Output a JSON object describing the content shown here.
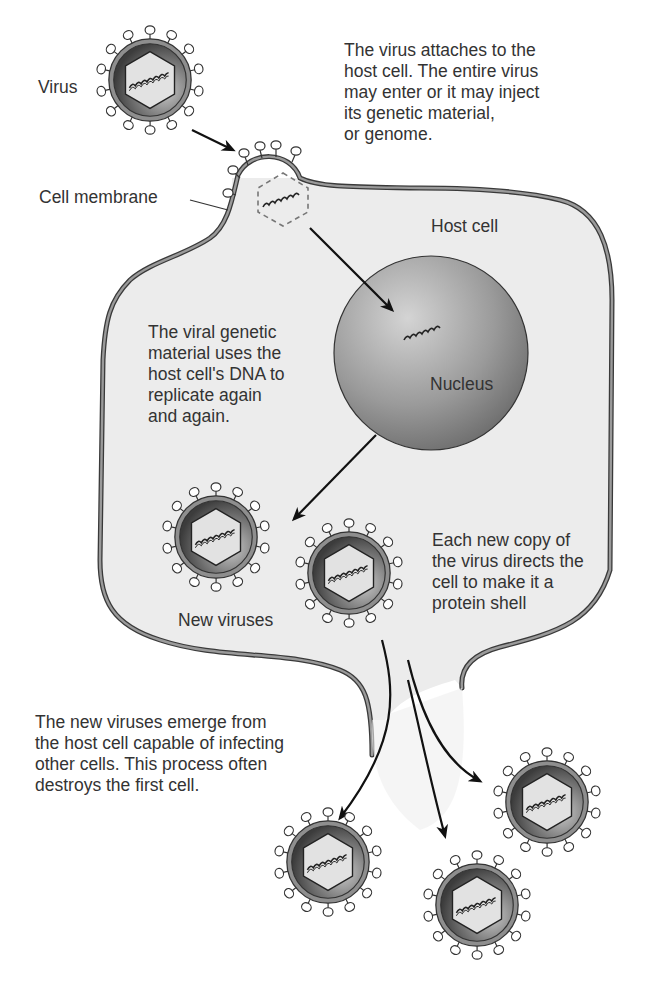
{
  "diagram": {
    "colors": {
      "cell_fill": "#ececec",
      "membrane": "#8c8c8c",
      "membrane_edge": "#3a3a3a",
      "virus_capsule_dark": "#4a4a4a",
      "virus_capsule_light": "#bdbdbd",
      "hexagon_fill": "#e0e0e0",
      "nucleus_light": "#c9c9c9",
      "nucleus_dark": "#6e6e6e",
      "arrow": "#111111",
      "text": "#333333"
    },
    "labels": {
      "virus": "Virus",
      "cell_membrane": "Cell membrane",
      "host_cell": "Host cell",
      "nucleus": "Nucleus",
      "new_viruses": "New viruses"
    },
    "captions": {
      "attach": "The virus attaches to the\nhost cell. The entire virus\nmay enter or it may inject\nits genetic material,\nor genome.",
      "replicate": "The viral genetic\nmaterial uses the\nhost cell's DNA to\nreplicate again\nand again.",
      "shell": "Each new copy of\nthe virus directs the\ncell to make it a\nprotein shell",
      "emerge": "The new viruses emerge from\nthe host cell capable of infecting\nother cells. This process often\ndestroys the first cell."
    },
    "icons": {
      "virus": "virus-icon",
      "nucleus": "nucleus-icon",
      "genome": "dna-strand-icon",
      "arrow": "arrow-icon"
    },
    "virus_positions": [
      {
        "name": "initial-virus",
        "x": 130,
        "y": 80
      },
      {
        "name": "new-virus-1",
        "x": 217,
        "y": 537
      },
      {
        "name": "new-virus-2",
        "x": 351,
        "y": 573
      },
      {
        "name": "released-virus-1",
        "x": 328,
        "y": 862
      },
      {
        "name": "released-virus-2",
        "x": 479,
        "y": 963
      },
      {
        "name": "released-virus-3",
        "x": 544,
        "y": 802
      }
    ]
  }
}
